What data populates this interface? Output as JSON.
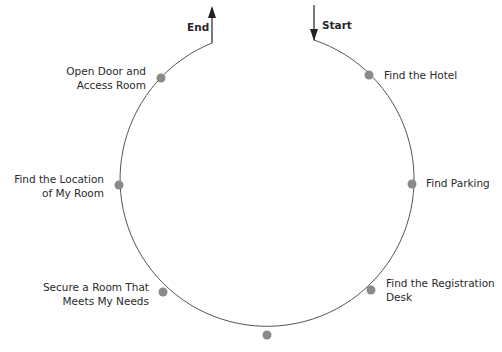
{
  "diagram": {
    "type": "cycle",
    "start_label": "Start",
    "end_label": "End",
    "colors": {
      "line": "#555555",
      "dot": "#8a8a8a",
      "text": "#2a2a2a"
    },
    "steps": [
      {
        "line1": "Find the Hotel",
        "line2": ""
      },
      {
        "line1": "Find Parking",
        "line2": ""
      },
      {
        "line1": "Find the Registration",
        "line2": "Desk"
      },
      {
        "line1": "",
        "line2": ""
      },
      {
        "line1": "Secure a Room That",
        "line2": "Meets My Needs"
      },
      {
        "line1": "Find the Location",
        "line2": "of My Room"
      },
      {
        "line1": "Open Door and",
        "line2": "Access Room"
      }
    ]
  }
}
